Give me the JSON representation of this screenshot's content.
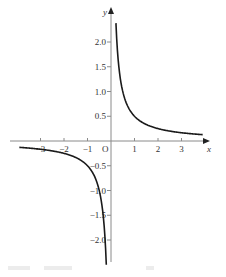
{
  "chart_data": {
    "type": "line",
    "title": "",
    "function": "y = 1/(2x)",
    "xlabel": "x",
    "ylabel": "y",
    "origin_label": "O",
    "xlim": [
      -4.0,
      4.2
    ],
    "ylim": [
      -2.6,
      2.4
    ],
    "x_ticks": [
      -3,
      -2,
      -1,
      1,
      2,
      3
    ],
    "x_tick_labels": [
      "−3",
      "−2",
      "−1",
      "1",
      "2",
      "3"
    ],
    "y_ticks": [
      2.0,
      1.5,
      1.0,
      0.5,
      -0.5,
      -1.0,
      -1.5,
      -2.0
    ],
    "y_tick_labels": [
      "2.0",
      "1.5",
      "1.0",
      "0.5",
      "−0.5",
      "−1.0",
      "−1.5",
      "−2.0"
    ],
    "grid": false,
    "legend": null,
    "series": [
      {
        "name": "positive branch",
        "x": [
          0.21,
          0.25,
          0.3,
          0.4,
          0.5,
          0.75,
          1.0,
          1.5,
          2.0,
          2.5,
          3.0,
          3.5,
          3.9
        ],
        "y": [
          2.38,
          2.0,
          1.67,
          1.25,
          1.0,
          0.67,
          0.5,
          0.33,
          0.25,
          0.2,
          0.17,
          0.14,
          0.13
        ]
      },
      {
        "name": "negative branch",
        "x": [
          -3.9,
          -3.5,
          -3.0,
          -2.5,
          -2.0,
          -1.5,
          -1.0,
          -0.75,
          -0.5,
          -0.4,
          -0.3,
          -0.25,
          -0.2
        ],
        "y": [
          -0.13,
          -0.14,
          -0.17,
          -0.2,
          -0.25,
          -0.33,
          -0.5,
          -0.67,
          -1.0,
          -1.25,
          -1.67,
          -2.0,
          -2.5
        ]
      }
    ]
  }
}
